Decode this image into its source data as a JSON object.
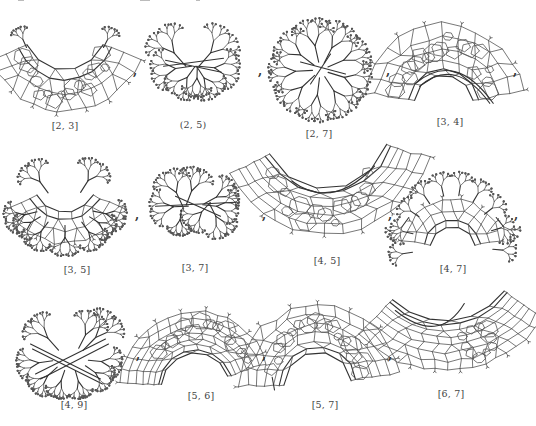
{
  "figure": {
    "panels": [
      {
        "id": "p23",
        "label": "[2, 3]",
        "row": 0,
        "col": 0,
        "shape": "bowl",
        "cx": 65,
        "cy": 70,
        "w": 110,
        "h": 90,
        "label_x": 65,
        "label_y": 120
      },
      {
        "id": "p25",
        "label": "(2, 5)",
        "row": 0,
        "col": 1,
        "shape": "tree-bowl",
        "cx": 193,
        "cy": 70,
        "w": 115,
        "h": 85,
        "label_x": 193,
        "label_y": 119
      },
      {
        "id": "p27",
        "label": "[2, 7]",
        "row": 0,
        "col": 2,
        "shape": "star-tree",
        "cx": 320,
        "cy": 70,
        "w": 115,
        "h": 100,
        "label_x": 319,
        "label_y": 128
      },
      {
        "id": "p34",
        "label": "[3, 4]",
        "row": 0,
        "col": 3,
        "shape": "crescent-up",
        "cx": 449,
        "cy": 62,
        "w": 115,
        "h": 85,
        "label_x": 450,
        "label_y": 116
      },
      {
        "id": "p35",
        "label": "[3, 5]",
        "row": 1,
        "col": 0,
        "shape": "tree-bowl-deep",
        "cx": 65,
        "cy": 212,
        "w": 110,
        "h": 90,
        "label_x": 77,
        "label_y": 264
      },
      {
        "id": "p37",
        "label": "[3, 7]",
        "row": 1,
        "col": 1,
        "shape": "tree-wide",
        "cx": 195,
        "cy": 210,
        "w": 115,
        "h": 85,
        "label_x": 195,
        "label_y": 262
      },
      {
        "id": "p45",
        "label": "[4, 5]",
        "row": 1,
        "col": 2,
        "shape": "smile-sheet",
        "cx": 320,
        "cy": 203,
        "w": 115,
        "h": 75,
        "label_x": 327,
        "label_y": 255
      },
      {
        "id": "p47",
        "label": "[4, 7]",
        "row": 1,
        "col": 3,
        "shape": "tree-bowl-inverted",
        "cx": 452,
        "cy": 213,
        "w": 115,
        "h": 90,
        "label_x": 453,
        "label_y": 263
      },
      {
        "id": "p49",
        "label": "[4, 9]",
        "row": 2,
        "col": 0,
        "shape": "butterfly",
        "cx": 65,
        "cy": 350,
        "w": 110,
        "h": 85,
        "label_x": 74,
        "label_y": 399
      },
      {
        "id": "p56",
        "label": "[5, 6]",
        "row": 2,
        "col": 1,
        "shape": "dome-sheet",
        "cx": 195,
        "cy": 345,
        "w": 115,
        "h": 75,
        "label_x": 201,
        "label_y": 390
      },
      {
        "id": "p57",
        "label": "[5, 7]",
        "row": 2,
        "col": 2,
        "shape": "arch-sheet",
        "cx": 320,
        "cy": 347,
        "w": 115,
        "h": 85,
        "label_x": 325,
        "label_y": 399
      },
      {
        "id": "p67",
        "label": "[6, 7]",
        "row": 2,
        "col": 3,
        "shape": "cusp-sheet",
        "cx": 450,
        "cy": 342,
        "w": 115,
        "h": 70,
        "label_x": 451,
        "label_y": 388
      }
    ],
    "separators": [
      {
        "text": ",",
        "x": 133,
        "y": 64
      },
      {
        "text": ",",
        "x": 258,
        "y": 64
      },
      {
        "text": ",",
        "x": 386,
        "y": 64
      },
      {
        "text": ",",
        "x": 513,
        "y": 64
      },
      {
        "text": ",",
        "x": 135,
        "y": 208
      },
      {
        "text": ",",
        "x": 262,
        "y": 208
      },
      {
        "text": ",",
        "x": 388,
        "y": 208
      },
      {
        "text": ",",
        "x": 514,
        "y": 208
      },
      {
        "text": ",",
        "x": 136,
        "y": 348
      },
      {
        "text": ",",
        "x": 262,
        "y": 348
      },
      {
        "text": ",",
        "x": 388,
        "y": 348
      }
    ]
  },
  "colors": {
    "ink": "#555555",
    "ink_dark": "#333333",
    "background": "#ffffff"
  }
}
